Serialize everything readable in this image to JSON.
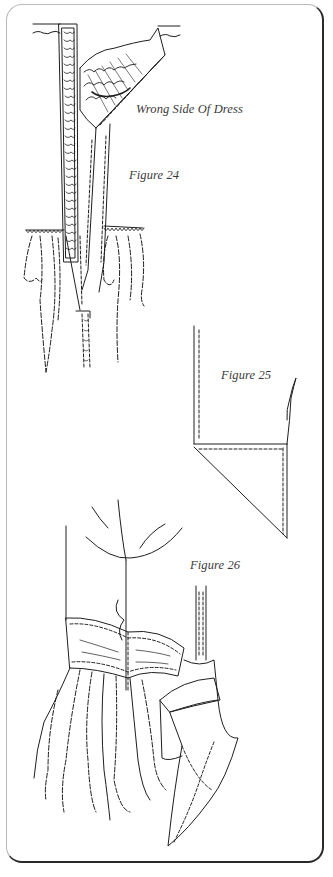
{
  "document": {
    "type": "sewing-instruction-illustration",
    "frame": {
      "border_color": "#2a2a2a",
      "light_border_color": "#b8b8b8",
      "background": "#ffffff"
    }
  },
  "figures": [
    {
      "id": "fig24",
      "label": "Figure 24",
      "annotation": "Wrong Side Of Dress"
    },
    {
      "id": "fig25",
      "label": "Figure 25"
    },
    {
      "id": "fig26",
      "label": "Figure 26"
    }
  ],
  "colors": {
    "ink": "#1e1e1e",
    "text": "#3a3a3a"
  }
}
